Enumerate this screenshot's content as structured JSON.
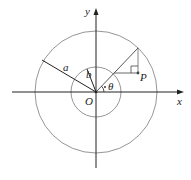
{
  "diagram": {
    "origin": {
      "x": 96,
      "y": 92
    },
    "outer_circle": {
      "radius": 61,
      "label": "a",
      "color": "#8a8a8a"
    },
    "inner_circle": {
      "radius": 25,
      "label": "b",
      "color": "#8a8a8a"
    },
    "axes": {
      "x_label": "y_axis_unused",
      "x": {
        "label": "x",
        "from": 12,
        "to": 184
      },
      "y": {
        "label": "y",
        "from": 168,
        "to": 8
      },
      "color": "#222222"
    },
    "labels": {
      "origin": "O",
      "x_axis": "x",
      "y_axis": "y",
      "outer_radius": "a",
      "inner_radius": "b",
      "angle": "θ",
      "point": "P"
    },
    "construction": {
      "ray_end_outer": {
        "x": 138,
        "y": 48
      },
      "ray_at_inner": {
        "x": 114,
        "y": 73
      },
      "point_P": {
        "x": 138,
        "y": 73
      },
      "right_angle_box": {
        "x": 131,
        "y": 66,
        "size": 7
      }
    }
  }
}
